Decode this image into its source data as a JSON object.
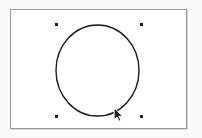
{
  "app": {
    "type": "vector-drawing-canvas",
    "background_color": "#fafafa",
    "canvas_color": "#ffffff"
  },
  "canvas": {
    "name": "drawing-canvas",
    "x": 10,
    "y": 9,
    "width": 177,
    "height": 120,
    "border_color": "#9a9a9a",
    "border_width": 1
  },
  "shapes": [
    {
      "name": "circle-shape",
      "type": "ellipse",
      "selected": true,
      "center_x": 97.5,
      "center_y": 70.5,
      "radius_x": 41.5,
      "radius_y": 45.5,
      "stroke_color": "#1a1a1a",
      "stroke_width": 1.4,
      "fill": "none"
    }
  ],
  "selection": {
    "name": "selection-handles",
    "handle_color": "#1d1d1d",
    "handle_size": 3,
    "handles": [
      {
        "name": "handle-top-left",
        "x": 55,
        "y": 23
      },
      {
        "name": "handle-top-right",
        "x": 140,
        "y": 23
      },
      {
        "name": "handle-bottom-left",
        "x": 55,
        "y": 115
      },
      {
        "name": "handle-bottom-right",
        "x": 140,
        "y": 115
      }
    ]
  },
  "cursor": {
    "name": "mouse-pointer",
    "type": "arrow",
    "x": 113,
    "y": 108,
    "fill_color": "#1a1a1a",
    "outline_color": "#ffffff"
  }
}
